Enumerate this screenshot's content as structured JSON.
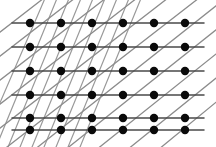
{
  "figure": {
    "width": 216,
    "height": 147,
    "background_color": "#ffffff"
  },
  "chart_data": {
    "type": "scatter",
    "subtitle": "",
    "xlabel": "",
    "ylabel": "",
    "xlim": [
      0,
      216
    ],
    "ylim": [
      0,
      147
    ],
    "grid": false,
    "legend_position": "none",
    "tick_labels_x": [],
    "tick_labels_y": [],
    "annotations": [],
    "lattice": {
      "columns": 6,
      "rows": 6,
      "column_x": [
        30,
        61,
        92,
        123,
        154,
        185
      ],
      "row_y": [
        23,
        47,
        71,
        95,
        118,
        130
      ],
      "dot_radius": 4.2,
      "dot_color": "#0a0a0a"
    },
    "series": [
      {
        "name": "lattice points",
        "marker": "filled-circle",
        "color": "#0a0a0a",
        "points": [
          {
            "x": 30,
            "y": 23
          },
          {
            "x": 61,
            "y": 23
          },
          {
            "x": 92,
            "y": 23
          },
          {
            "x": 123,
            "y": 23
          },
          {
            "x": 154,
            "y": 23
          },
          {
            "x": 185,
            "y": 23
          },
          {
            "x": 30,
            "y": 47
          },
          {
            "x": 61,
            "y": 47
          },
          {
            "x": 92,
            "y": 47
          },
          {
            "x": 123,
            "y": 47
          },
          {
            "x": 154,
            "y": 47
          },
          {
            "x": 185,
            "y": 47
          },
          {
            "x": 30,
            "y": 71
          },
          {
            "x": 61,
            "y": 71
          },
          {
            "x": 92,
            "y": 71
          },
          {
            "x": 123,
            "y": 71
          },
          {
            "x": 154,
            "y": 71
          },
          {
            "x": 185,
            "y": 71
          },
          {
            "x": 30,
            "y": 95
          },
          {
            "x": 61,
            "y": 95
          },
          {
            "x": 92,
            "y": 95
          },
          {
            "x": 123,
            "y": 95
          },
          {
            "x": 154,
            "y": 95
          },
          {
            "x": 185,
            "y": 95
          },
          {
            "x": 30,
            "y": 118
          },
          {
            "x": 61,
            "y": 118
          },
          {
            "x": 92,
            "y": 118
          },
          {
            "x": 123,
            "y": 118
          },
          {
            "x": 154,
            "y": 118
          },
          {
            "x": 185,
            "y": 118
          },
          {
            "x": 30,
            "y": 130
          },
          {
            "x": 61,
            "y": 130
          },
          {
            "x": 92,
            "y": 130
          },
          {
            "x": 123,
            "y": 130
          },
          {
            "x": 154,
            "y": 130
          },
          {
            "x": 185,
            "y": 130
          }
        ]
      }
    ],
    "line_families": [
      {
        "name": "horizontal",
        "angle_degrees": 0,
        "color": "#4a4a4a",
        "stroke_width": 1.5,
        "count": 6,
        "lines": [
          {
            "x1": 12,
            "y1": 23,
            "x2": 204,
            "y2": 23
          },
          {
            "x1": 12,
            "y1": 47,
            "x2": 204,
            "y2": 47
          },
          {
            "x1": 12,
            "y1": 71,
            "x2": 204,
            "y2": 71
          },
          {
            "x1": 12,
            "y1": 95,
            "x2": 204,
            "y2": 95
          },
          {
            "x1": 12,
            "y1": 118,
            "x2": 204,
            "y2": 118
          },
          {
            "x1": 12,
            "y1": 130,
            "x2": 204,
            "y2": 130
          }
        ]
      },
      {
        "name": "shallow-diagonal",
        "angle_degrees": 38,
        "color": "#8c8c8c",
        "stroke_width": 1.3,
        "count": 11,
        "lines": [
          {
            "x1": -18,
            "y1": 46,
            "x2": 44,
            "y2": -2
          },
          {
            "x1": -18,
            "y1": 70,
            "x2": 75,
            "y2": -2
          },
          {
            "x1": -18,
            "y1": 94,
            "x2": 106,
            "y2": -2
          },
          {
            "x1": -18,
            "y1": 118,
            "x2": 137,
            "y2": -2
          },
          {
            "x1": -18,
            "y1": 142,
            "x2": 168,
            "y2": -2
          },
          {
            "x1": -2,
            "y1": 154,
            "x2": 199,
            "y2": -2
          },
          {
            "x1": 29,
            "y1": 154,
            "x2": 226,
            "y2": -2
          },
          {
            "x1": 60,
            "y1": 154,
            "x2": 226,
            "y2": 22
          },
          {
            "x1": 91,
            "y1": 154,
            "x2": 226,
            "y2": 46
          },
          {
            "x1": 122,
            "y1": 154,
            "x2": 226,
            "y2": 70
          },
          {
            "x1": 153,
            "y1": 154,
            "x2": 226,
            "y2": 94
          }
        ]
      },
      {
        "name": "steep-diagonal",
        "angle_degrees": 66,
        "color": "#9a9a9a",
        "stroke_width": 1.2,
        "count": 9,
        "region": "left-and-center",
        "lines": [
          {
            "x1": -6,
            "y1": 152,
            "x2": 58,
            "y2": -4
          },
          {
            "x1": 6,
            "y1": 152,
            "x2": 70,
            "y2": -4
          },
          {
            "x1": 18,
            "y1": 152,
            "x2": 82,
            "y2": -4
          },
          {
            "x1": 30,
            "y1": 152,
            "x2": 94,
            "y2": -4
          },
          {
            "x1": 42,
            "y1": 152,
            "x2": 106,
            "y2": -4
          },
          {
            "x1": 54,
            "y1": 152,
            "x2": 118,
            "y2": -4
          },
          {
            "x1": 66,
            "y1": 152,
            "x2": 130,
            "y2": -4
          },
          {
            "x1": 78,
            "y1": 152,
            "x2": 142,
            "y2": -4
          },
          {
            "x1": -16,
            "y1": 140,
            "x2": 46,
            "y2": -4
          }
        ]
      }
    ]
  }
}
